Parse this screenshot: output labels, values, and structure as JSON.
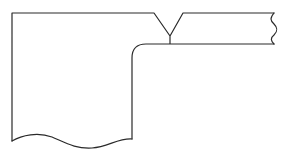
{
  "diagram": {
    "type": "line-drawing",
    "stroke_color": "#2a2a2a",
    "background": "#ffffff",
    "parts": [
      {
        "name": "plate",
        "shape": "vertical block with rounded inner corner and wavy bottom break line"
      },
      {
        "name": "bar",
        "shape": "horizontal bar with wavy right break line"
      },
      {
        "name": "weld",
        "shape": "V-groove joint"
      }
    ]
  }
}
